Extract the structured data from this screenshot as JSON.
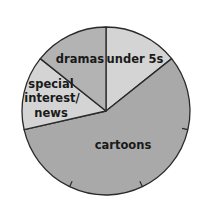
{
  "chart_data": {
    "type": "pie",
    "title": "",
    "categories": [
      "under 5s",
      "cartoons",
      "special interest/news",
      "dramas"
    ],
    "values": [
      1,
      4,
      1,
      1
    ],
    "fractions": [
      "1/7",
      "4/7",
      "1/7",
      "1/7"
    ],
    "percentages": [
      14.3,
      57.1,
      14.3,
      14.3
    ],
    "start_angle_deg": 0,
    "direction": "clockwise",
    "tick_marks": "circumference divided into sevenths; small ticks inside cartoons slice",
    "colors": [
      "#d4d4d4",
      "#a9a9a9",
      "#d4d4d4",
      "#b3b3b3"
    ],
    "labels": {
      "under5s": "under 5s",
      "cartoons": "cartoons",
      "special_line1": "special",
      "special_line2": "interest/",
      "special_line3": "news",
      "dramas": "dramas"
    }
  }
}
